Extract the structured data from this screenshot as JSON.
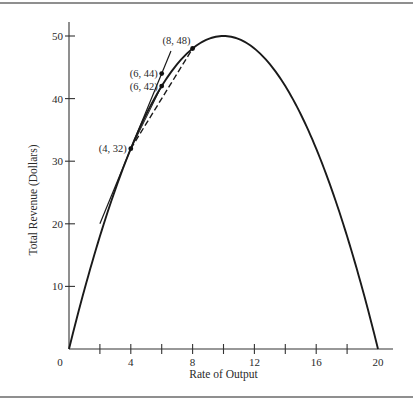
{
  "chart_data": {
    "type": "line",
    "title": "",
    "xlabel": "Rate of Output",
    "ylabel": "Total Revenue (Dollars)",
    "xlim": [
      0,
      20
    ],
    "ylim": [
      0,
      50
    ],
    "grid": false,
    "legend": "none",
    "x_ticks": [
      2,
      4,
      6,
      8,
      10,
      12,
      14,
      16,
      18
    ],
    "x_tick_labels": [
      {
        "value": 0,
        "label": "0"
      },
      {
        "value": 4,
        "label": "4"
      },
      {
        "value": 8,
        "label": "8"
      },
      {
        "value": 12,
        "label": "12"
      },
      {
        "value": 16,
        "label": "16"
      },
      {
        "value": 20,
        "label": "20"
      }
    ],
    "y_tick_labels": [
      {
        "value": 10,
        "label": "10"
      },
      {
        "value": 20,
        "label": "20"
      },
      {
        "value": 30,
        "label": "30"
      },
      {
        "value": 40,
        "label": "40"
      },
      {
        "value": 50,
        "label": "50"
      }
    ],
    "series": [
      {
        "name": "Total Revenue",
        "style": "solid-thick",
        "function": "TR = 10x - 0.5x^2",
        "x": [
          0,
          1,
          2,
          3,
          4,
          5,
          6,
          7,
          8,
          9,
          10,
          11,
          12,
          13,
          14,
          15,
          16,
          17,
          18,
          19,
          20
        ],
        "y": [
          0,
          9.5,
          18,
          25.5,
          32,
          37.5,
          42,
          45.5,
          48,
          49.5,
          50,
          49.5,
          48,
          45.5,
          42,
          37.5,
          32,
          25.5,
          18,
          9.5,
          0
        ]
      },
      {
        "name": "Tangent at (4, 32)",
        "style": "solid-thin",
        "x": [
          2,
          6.6
        ],
        "y": [
          20,
          47.6
        ]
      },
      {
        "name": "Secant (4, 32)-(6, 42)",
        "style": "solid-thin",
        "x": [
          4,
          6
        ],
        "y": [
          32,
          42
        ]
      },
      {
        "name": "Secant (4, 32)-(8, 48)",
        "style": "dashed",
        "x": [
          4,
          8
        ],
        "y": [
          32,
          48
        ]
      }
    ],
    "annotations": [
      {
        "x": 4,
        "y": 32,
        "label": "(4, 32)",
        "anchor": "left"
      },
      {
        "x": 6,
        "y": 42,
        "label": "(6, 42)",
        "anchor": "left"
      },
      {
        "x": 6,
        "y": 44,
        "label": "(6, 44)",
        "anchor": "left"
      },
      {
        "x": 8,
        "y": 48,
        "label": "(8, 48)",
        "anchor": "above-left"
      }
    ]
  }
}
